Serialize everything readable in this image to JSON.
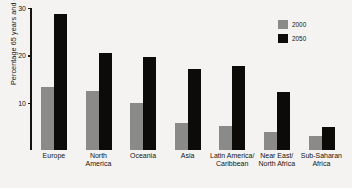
{
  "chart_data": {
    "type": "bar",
    "title": "",
    "xlabel": "",
    "ylabel": "Percentage 65 years and older",
    "ylim": [
      0,
      30
    ],
    "yticks": [
      0,
      10,
      20,
      30
    ],
    "ytick_labels": [
      "",
      "10",
      "20",
      "30"
    ],
    "grid": false,
    "legend_position": "top-right",
    "categories": [
      "Europe",
      "North\nAmerica",
      "Oceania",
      "Asia",
      "Latin America/\nCaribbean",
      "Near East/\nNorth Africa",
      "Sub-Saharan\nAfrica"
    ],
    "series": [
      {
        "name": "2000",
        "color": "#8a8a88",
        "values": [
          13.3,
          12.4,
          10.0,
          5.7,
          5.0,
          3.8,
          3.0
        ]
      },
      {
        "name": "2050",
        "color": "#0d0b08",
        "values": [
          28.7,
          20.6,
          19.6,
          17.2,
          17.8,
          12.2,
          4.8
        ]
      }
    ]
  },
  "legend": {
    "items": [
      {
        "label": "2000"
      },
      {
        "label": "2050"
      }
    ]
  },
  "axis": {
    "y_title": "Percentage 65 years and older",
    "ticks": [
      {
        "label": "30",
        "value": 30
      },
      {
        "label": "20",
        "value": 20
      },
      {
        "label": "10",
        "value": 10
      }
    ]
  }
}
